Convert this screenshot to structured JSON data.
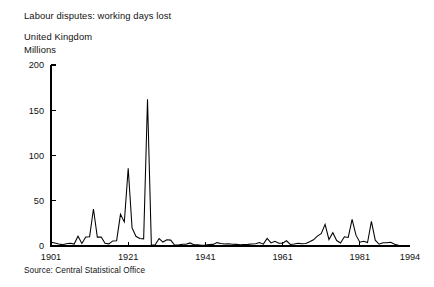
{
  "chart_data": {
    "type": "line",
    "title": "Labour disputes: working days lost",
    "subtitle": "United Kingdom",
    "ylabel": "Millions",
    "xlabel": "",
    "source": "Source: Central Statistical Office",
    "grid": false,
    "legend": "none",
    "xlim": [
      1901,
      1994
    ],
    "ylim": [
      0,
      200
    ],
    "yticks": [
      0,
      50,
      100,
      150,
      200
    ],
    "ytick_labels": [
      "0",
      "50",
      "100",
      "150",
      "200"
    ],
    "xticks": [
      1901,
      1921,
      1941,
      1961,
      1981,
      1994
    ],
    "xtick_labels": [
      "1901",
      "1921",
      "1941",
      "1961",
      "1981",
      "1994"
    ],
    "series": [
      {
        "name": "Working days lost (millions)",
        "color": "#000000",
        "x": [
          1901,
          1902,
          1903,
          1904,
          1905,
          1906,
          1907,
          1908,
          1909,
          1910,
          1911,
          1912,
          1913,
          1914,
          1915,
          1916,
          1917,
          1918,
          1919,
          1920,
          1921,
          1922,
          1923,
          1924,
          1925,
          1926,
          1927,
          1928,
          1929,
          1930,
          1931,
          1932,
          1933,
          1934,
          1935,
          1936,
          1937,
          1938,
          1939,
          1940,
          1941,
          1942,
          1943,
          1944,
          1945,
          1946,
          1947,
          1948,
          1949,
          1950,
          1951,
          1952,
          1953,
          1954,
          1955,
          1956,
          1957,
          1958,
          1959,
          1960,
          1961,
          1962,
          1963,
          1964,
          1965,
          1966,
          1967,
          1968,
          1969,
          1970,
          1971,
          1972,
          1973,
          1974,
          1975,
          1976,
          1977,
          1978,
          1979,
          1980,
          1981,
          1982,
          1983,
          1984,
          1985,
          1986,
          1987,
          1988,
          1989,
          1990,
          1991,
          1992,
          1993,
          1994
        ],
        "values": [
          4.1,
          3.4,
          2.3,
          1.5,
          2.4,
          3.0,
          2.1,
          10.8,
          2.8,
          9.9,
          10.3,
          40.9,
          9.8,
          9.9,
          3.0,
          2.4,
          5.6,
          5.9,
          35.0,
          26.6,
          85.9,
          19.9,
          10.7,
          8.4,
          7.9,
          162.2,
          1.2,
          1.4,
          8.3,
          4.4,
          6.9,
          6.5,
          1.1,
          0.96,
          1.96,
          1.83,
          3.41,
          1.33,
          1.36,
          0.94,
          1.08,
          1.53,
          1.81,
          3.71,
          2.84,
          2.16,
          2.43,
          1.94,
          1.81,
          1.39,
          1.69,
          1.79,
          2.18,
          2.46,
          3.78,
          2.08,
          8.41,
          3.46,
          5.27,
          3.02,
          3.05,
          5.8,
          1.76,
          2.28,
          2.93,
          2.4,
          2.79,
          4.69,
          6.85,
          10.98,
          13.55,
          23.9,
          7.2,
          14.75,
          6.01,
          3.28,
          10.14,
          9.41,
          29.47,
          11.96,
          4.27,
          5.31,
          3.75,
          27.14,
          6.4,
          1.92,
          3.55,
          3.7,
          4.13,
          1.9,
          0.76,
          0.53,
          0.65,
          0.28
        ]
      }
    ]
  },
  "axes": {
    "y_ticks": [
      {
        "label": "200",
        "value": 200
      },
      {
        "label": "150",
        "value": 150
      },
      {
        "label": "100",
        "value": 100
      },
      {
        "label": "50",
        "value": 50
      },
      {
        "label": "0",
        "value": 0
      }
    ],
    "x_ticks": [
      {
        "label": "1901",
        "value": 1901
      },
      {
        "label": "1921",
        "value": 1921
      },
      {
        "label": "1941",
        "value": 1941
      },
      {
        "label": "1961",
        "value": 1961
      },
      {
        "label": "1981",
        "value": 1981
      },
      {
        "label": "1994",
        "value": 1994
      }
    ]
  }
}
